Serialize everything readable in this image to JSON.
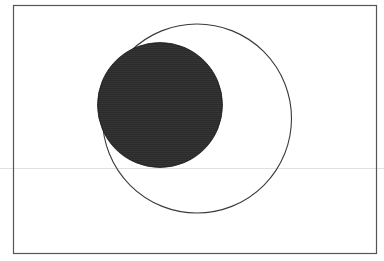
{
  "diagram": {
    "type": "venn-like",
    "frame": {
      "x": 13.5,
      "y": 5.5,
      "width": 363,
      "height": 248,
      "stroke": "#555555",
      "stroke_width": 1.2
    },
    "shapes": [
      {
        "name": "outer-circle",
        "kind": "circle",
        "cx": 197,
        "cy": 118.5,
        "r": 94.5,
        "fill": "none",
        "stroke": "#3a3a3a",
        "stroke_width": 1.1
      },
      {
        "name": "filled-circle",
        "kind": "circle",
        "cx": 160,
        "cy": 105,
        "r": 62.5,
        "fill": "#2b2b2b",
        "stroke": "#1a1a1a",
        "stroke_width": 0.8
      }
    ],
    "artifacts": {
      "scan_line": {
        "y": 168.5,
        "color": "#d8d8d8"
      }
    }
  }
}
